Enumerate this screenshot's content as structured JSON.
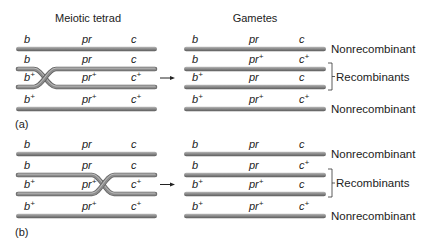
{
  "titles": {
    "left": "Meiotic tetrad",
    "right": "Gametes"
  },
  "colors": {
    "chromatid_fill": "#8a8a8a",
    "chromatid_highlight": "#bdbdbd",
    "chromatid_shadow": "#5e5e5e",
    "text": "#222222"
  },
  "panels": [
    {
      "label": "(a)",
      "crossover_position": "between b and pr",
      "tetrad": [
        {
          "genes": [
            {
              "name": "b",
              "plus": false
            },
            {
              "name": "pr",
              "plus": false
            },
            {
              "name": "c",
              "plus": false
            }
          ]
        },
        {
          "genes": [
            {
              "name": "b",
              "plus": false
            },
            {
              "name": "pr",
              "plus": false
            },
            {
              "name": "c",
              "plus": false
            }
          ]
        },
        {
          "genes": [
            {
              "name": "b",
              "plus": true
            },
            {
              "name": "pr",
              "plus": true
            },
            {
              "name": "c",
              "plus": true
            }
          ]
        },
        {
          "genes": [
            {
              "name": "b",
              "plus": true
            },
            {
              "name": "pr",
              "plus": true
            },
            {
              "name": "c",
              "plus": true
            }
          ]
        }
      ],
      "gametes": [
        {
          "genes": [
            {
              "name": "b",
              "plus": false
            },
            {
              "name": "pr",
              "plus": false
            },
            {
              "name": "c",
              "plus": false
            }
          ],
          "type": "Nonrecombinant"
        },
        {
          "genes": [
            {
              "name": "b",
              "plus": false
            },
            {
              "name": "pr",
              "plus": true
            },
            {
              "name": "c",
              "plus": true
            }
          ],
          "type": "Recombinant"
        },
        {
          "genes": [
            {
              "name": "b",
              "plus": true
            },
            {
              "name": "pr",
              "plus": false
            },
            {
              "name": "c",
              "plus": false
            }
          ],
          "type": "Recombinant"
        },
        {
          "genes": [
            {
              "name": "b",
              "plus": true
            },
            {
              "name": "pr",
              "plus": true
            },
            {
              "name": "c",
              "plus": true
            }
          ],
          "type": "Nonrecombinant"
        }
      ],
      "side_labels": {
        "top": "Nonrecombinant",
        "middle": "Recombinants",
        "bottom": "Nonrecombinant"
      }
    },
    {
      "label": "(b)",
      "crossover_position": "between pr and c",
      "tetrad": [
        {
          "genes": [
            {
              "name": "b",
              "plus": false
            },
            {
              "name": "pr",
              "plus": false
            },
            {
              "name": "c",
              "plus": false
            }
          ]
        },
        {
          "genes": [
            {
              "name": "b",
              "plus": false
            },
            {
              "name": "pr",
              "plus": false
            },
            {
              "name": "c",
              "plus": false
            }
          ]
        },
        {
          "genes": [
            {
              "name": "b",
              "plus": true
            },
            {
              "name": "pr",
              "plus": true
            },
            {
              "name": "c",
              "plus": true
            }
          ]
        },
        {
          "genes": [
            {
              "name": "b",
              "plus": true
            },
            {
              "name": "pr",
              "plus": true
            },
            {
              "name": "c",
              "plus": true
            }
          ]
        }
      ],
      "gametes": [
        {
          "genes": [
            {
              "name": "b",
              "plus": false
            },
            {
              "name": "pr",
              "plus": false
            },
            {
              "name": "c",
              "plus": false
            }
          ],
          "type": "Nonrecombinant"
        },
        {
          "genes": [
            {
              "name": "b",
              "plus": false
            },
            {
              "name": "pr",
              "plus": false
            },
            {
              "name": "c",
              "plus": true
            }
          ],
          "type": "Recombinant"
        },
        {
          "genes": [
            {
              "name": "b",
              "plus": true
            },
            {
              "name": "pr",
              "plus": true
            },
            {
              "name": "c",
              "plus": false
            }
          ],
          "type": "Recombinant"
        },
        {
          "genes": [
            {
              "name": "b",
              "plus": true
            },
            {
              "name": "pr",
              "plus": true
            },
            {
              "name": "c",
              "plus": true
            }
          ],
          "type": "Nonrecombinant"
        }
      ],
      "side_labels": {
        "top": "Nonrecombinant",
        "middle": "Recombinants",
        "bottom": "Nonrecombinant"
      }
    }
  ],
  "arrow_icon": "right-arrow-icon",
  "superscript": "+"
}
